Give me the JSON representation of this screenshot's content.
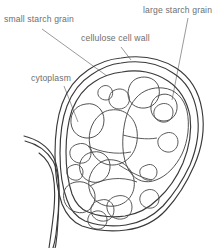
{
  "diagram": {
    "background_color": "#ffffff",
    "line_color": "#3a3a3a",
    "label_color": "#6e6e6e",
    "labels": [
      {
        "id": "small-starch-grain",
        "text": "small starch grain",
        "x": 4,
        "y": 22
      },
      {
        "id": "large-starch-grain",
        "text": "large starch grain",
        "x": 143,
        "y": 13
      },
      {
        "id": "cellulose-cell-wall",
        "text": "cellulose cell wall",
        "x": 81,
        "y": 41
      },
      {
        "id": "cytoplasm",
        "text": "cytoplasm",
        "x": 31,
        "y": 81
      }
    ]
  }
}
